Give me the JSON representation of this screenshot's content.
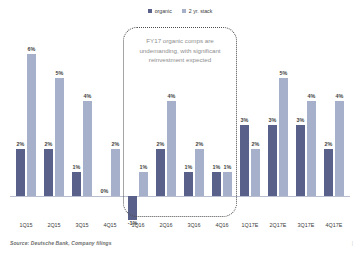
{
  "legend": {
    "entries": [
      {
        "label": "organic",
        "color": "#59618a",
        "icon": "square-swatch-icon"
      },
      {
        "label": "2 yr. stack",
        "color": "#a7b0cb",
        "icon": "square-swatch-icon"
      }
    ]
  },
  "callout": {
    "text": "FY17 organic comps are undemanding, with significant reinvestment expected"
  },
  "source": {
    "text": "Source: Deutsche Bank, Company filings"
  },
  "page_mark": {
    "text": "|"
  },
  "chart_data": {
    "type": "bar",
    "title": "",
    "subtitle": "",
    "xlabel": "",
    "ylabel": "",
    "ylim": [
      -1,
      6
    ],
    "grid": false,
    "legend_position": "top-center",
    "categories": [
      "1Q15",
      "2Q15",
      "3Q15",
      "4Q15",
      "1Q16",
      "2Q16",
      "3Q16",
      "4Q16",
      "1Q17E",
      "2Q17E",
      "3Q17E",
      "4Q17E"
    ],
    "series": [
      {
        "name": "organic",
        "color": "#59618a",
        "values": [
          2,
          2,
          1,
          0,
          -1,
          2,
          1,
          1,
          3,
          3,
          3,
          2
        ],
        "labels": [
          "2%",
          "2%",
          "1%",
          "0%",
          "-1%",
          "2%",
          "1%",
          "1%",
          "3%",
          "3%",
          "3%",
          "2%"
        ]
      },
      {
        "name": "2 yr. stack",
        "color": "#a7b0cb",
        "values": [
          6,
          5,
          4,
          2,
          1,
          4,
          2,
          1,
          2,
          5,
          4,
          4
        ],
        "labels": [
          "6%",
          "5%",
          "4%",
          "2%",
          "1%",
          "4%",
          "2%",
          "1%",
          "2%",
          "5%",
          "4%",
          "4%"
        ]
      }
    ],
    "annotations": [
      {
        "text": "FY17 organic comps are undemanding, with significant reinvestment expected",
        "shape": "dotted-rounded-rect",
        "covers": [
          "1Q16",
          "2Q16",
          "3Q16",
          "4Q16"
        ]
      }
    ]
  }
}
